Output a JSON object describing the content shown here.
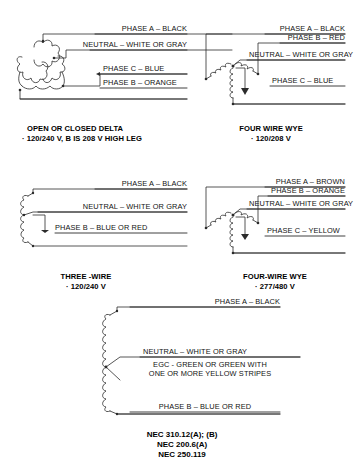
{
  "diagrams": [
    {
      "id": "open-closed-delta",
      "caption_title": "OPEN OR CLOSED DELTA",
      "caption_sub": "· 120/240 V, B IS 208 V HIGH LEG",
      "symbol": "delta-transformer-coils",
      "labels": [
        "PHASE A – BLACK",
        "NEUTRAL – WHITE OR GRAY",
        "PHASE C – BLUE",
        "PHASE B – ORANGE"
      ]
    },
    {
      "id": "four-wire-wye-120-208",
      "caption_title": "FOUR WIRE WYE",
      "caption_sub": "· 120/208 V",
      "symbol": "wye-transformer-coils",
      "labels": [
        "PHASE A – BLACK",
        "PHASE B – RED",
        "NEUTRAL – WHITE OR GRAY",
        "PHASE C – BLUE"
      ]
    },
    {
      "id": "three-wire",
      "caption_title": "THREE -WIRE",
      "caption_sub": "· 120/240 V",
      "symbol": "single-coil",
      "labels": [
        "PHASE A – BLACK",
        "NEUTRAL – WHITE OR GRAY",
        "PHASE B – BLUE OR RED"
      ]
    },
    {
      "id": "four-wire-wye-277-480",
      "caption_title": "FOUR-WIRE WYE",
      "caption_sub": "· 277/480 V",
      "symbol": "wye-transformer-coils",
      "labels": [
        "PHASE A – BROWN",
        "PHASE B – ORANGE",
        "NEUTRAL – WHITE OR GRAY",
        "PHASE C – YELLOW"
      ]
    },
    {
      "id": "grounded-single-coil",
      "caption_title": "",
      "caption_sub": "",
      "symbol": "tall-single-coil",
      "labels": [
        "PHASE A – BLACK",
        "NEUTRAL – WHITE OR GRAY",
        "EGC - GREEN OR GREEN WITH",
        "ONE OR MORE YELLOW STRIPES",
        "PHASE B – BLUE OR RED"
      ]
    }
  ],
  "nec_references": {
    "line1": "NEC 310.12(A); (B)",
    "line2": "NEC 200.6(A)",
    "line3": "NEC 250.119"
  },
  "colors": {
    "line": "#2b2b2b",
    "text": "#121212",
    "background": "#ffffff"
  }
}
